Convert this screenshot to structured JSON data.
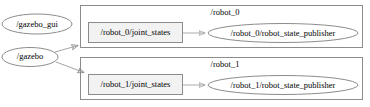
{
  "diagram": {
    "type": "ros-node-graph",
    "background_color": "#ffffff",
    "clusters": [
      {
        "id": "cluster-robot-0",
        "label": "/robot_0",
        "border_color": "#808080",
        "fill_color": "#ffffff",
        "x": 80,
        "y": 5,
        "w": 283,
        "h": 43,
        "label_x": 225,
        "label_y": 12,
        "nodes": [
          {
            "id": "node-robot0-joint-states",
            "shape": "box",
            "label": "/robot_0/joint_states",
            "fill_color": "#f0f0f0",
            "border_color": "#808080",
            "x": 88,
            "y": 22,
            "w": 95,
            "h": 21
          },
          {
            "id": "node-robot0-robot-state-publisher",
            "shape": "ellipse",
            "label": "/robot_0/robot_state_publisher",
            "fill_color": "#ffffff",
            "border_color": "#808080",
            "cx": 283,
            "cy": 33,
            "rx": 75,
            "ry": 9.5
          }
        ],
        "edges": [
          {
            "id": "edge-robot0-joint-states-to-publisher",
            "from": "node-robot0-joint-states",
            "to": "node-robot0-robot-state-publisher",
            "x1": 183,
            "y1": 33,
            "x2": 206,
            "y2": 33,
            "color": "#999999"
          }
        ]
      },
      {
        "id": "cluster-robot-1",
        "label": "/robot_1",
        "border_color": "#808080",
        "fill_color": "#ffffff",
        "x": 80,
        "y": 57,
        "w": 283,
        "h": 43,
        "label_x": 225,
        "label_y": 64,
        "nodes": [
          {
            "id": "node-robot1-joint-states",
            "shape": "box",
            "label": "/robot_1/joint_states",
            "fill_color": "#f0f0f0",
            "border_color": "#808080",
            "x": 88,
            "y": 74,
            "w": 95,
            "h": 21
          },
          {
            "id": "node-robot1-robot-state-publisher",
            "shape": "ellipse",
            "label": "/robot_1/robot_state_publisher",
            "fill_color": "#ffffff",
            "border_color": "#808080",
            "cx": 283,
            "cy": 85,
            "rx": 75,
            "ry": 9.5
          }
        ],
        "edges": [
          {
            "id": "edge-robot1-joint-states-to-publisher",
            "from": "node-robot1-joint-states",
            "to": "node-robot1-robot-state-publisher",
            "x1": 183,
            "y1": 85,
            "x2": 206,
            "y2": 85,
            "color": "#999999"
          }
        ]
      }
    ],
    "standalone_nodes": [
      {
        "id": "node-gazebo-gui",
        "shape": "ellipse",
        "label": "/gazebo_gui",
        "fill_color": "#ffffff",
        "border_color": "#808080",
        "cx": 37,
        "cy": 24,
        "rx": 35,
        "ry": 10
      },
      {
        "id": "node-gazebo",
        "shape": "ellipse",
        "label": "/gazebo",
        "fill_color": "#ffffff",
        "border_color": "#808080",
        "cx": 30,
        "cy": 57,
        "rx": 28,
        "ry": 9.5
      }
    ],
    "cross_edges": [
      {
        "id": "edge-gazebo-to-robot-0",
        "from": "node-gazebo",
        "to": "cluster-robot-0",
        "x1": 56,
        "y1": 52,
        "x2": 80,
        "y2": 45,
        "color": "#999999"
      },
      {
        "id": "edge-gazebo-to-robot-1",
        "from": "node-gazebo",
        "to": "cluster-robot-1",
        "x1": 57,
        "y1": 62,
        "x2": 86,
        "y2": 73,
        "color": "#999999"
      }
    ],
    "text_sizes": {
      "node_label_px": 8.5,
      "cluster_label_px": 8.5
    }
  }
}
